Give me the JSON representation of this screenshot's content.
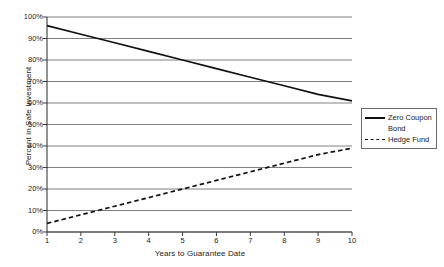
{
  "chart_data": {
    "type": "line",
    "title": "",
    "xlabel": "Years to Guarantee Date",
    "ylabel": "Percent in Safe Investment",
    "x": [
      1,
      2,
      3,
      4,
      5,
      6,
      7,
      8,
      9,
      10
    ],
    "xlim": [
      1,
      10
    ],
    "ylim": [
      0,
      100
    ],
    "grid": "horizontal",
    "legend_position": "right",
    "x_tick_labels": [
      "1",
      "2",
      "3",
      "4",
      "5",
      "6",
      "7",
      "8",
      "9",
      "10"
    ],
    "y_tick_labels": [
      "0%",
      "10%",
      "20%",
      "30%",
      "40%",
      "50%",
      "60%",
      "70%",
      "80%",
      "90%",
      "100%"
    ],
    "y_tick_values": [
      0,
      10,
      20,
      30,
      40,
      50,
      60,
      70,
      80,
      90,
      100
    ],
    "series": [
      {
        "name": "Zero Coupon Bond",
        "style": "solid",
        "color": "#111111",
        "values": [
          96,
          92,
          88,
          84,
          80,
          76,
          72,
          68,
          64,
          61
        ]
      },
      {
        "name": "Hedge Fund",
        "style": "dashed",
        "color": "#111111",
        "values": [
          4,
          8,
          12,
          16,
          20,
          24,
          28,
          32,
          36,
          39
        ]
      }
    ]
  },
  "legend": {
    "entries": [
      {
        "label_line1": "Zero Coupon",
        "label_line2": "Bond",
        "style": "solid"
      },
      {
        "label_line1": "Hedge Fund",
        "label_line2": "",
        "style": "dashed"
      }
    ]
  },
  "axes": {
    "y_title": "Percent in Safe Investment",
    "x_title": "Years to Guarantee Date"
  },
  "colors": {
    "gridline": "#808080",
    "axis": "#3a3a3a",
    "series": "#111111",
    "background": "#ffffff",
    "legend_border": "#6b6b6b"
  }
}
